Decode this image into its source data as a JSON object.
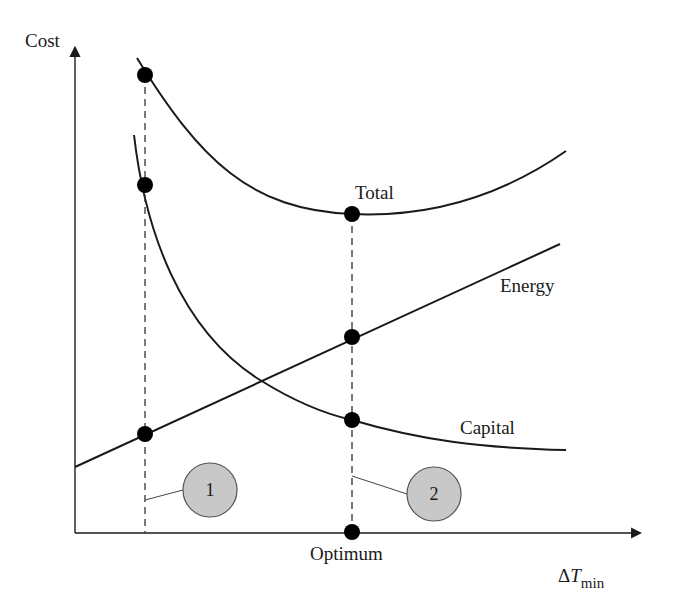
{
  "diagram": {
    "y_axis_label": "Cost",
    "x_axis_label": {
      "main": "ΔT",
      "italic_var": "T",
      "delta": "Δ",
      "subscript": "min"
    },
    "optimum_label": "Optimum",
    "curves": [
      {
        "id": "total",
        "label": "Total"
      },
      {
        "id": "energy",
        "label": "Energy"
      },
      {
        "id": "capital",
        "label": "Capital"
      }
    ],
    "callouts": [
      {
        "id": "1",
        "text": "1"
      },
      {
        "id": "2",
        "text": "2"
      }
    ],
    "colors": {
      "line": "#1a1a1a",
      "marker": "#000000",
      "callout_fill": "#c8c8c8",
      "callout_stroke": "#555555"
    }
  }
}
